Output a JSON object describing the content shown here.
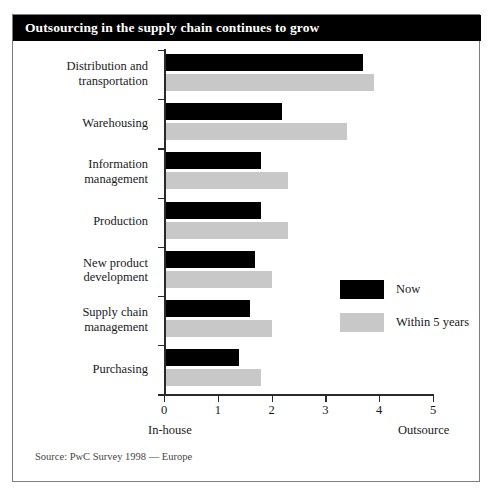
{
  "figure": {
    "title": "Outsourcing in the supply chain continues to grow",
    "source_note": "Source: PwC Survey 1998 — Europe"
  },
  "legend": {
    "position": "inside-right",
    "items": [
      {
        "label": "Now",
        "color": "#000000",
        "swatch_name": "legend-swatch-now"
      },
      {
        "label": "Within 5 years",
        "color": "#c8c8c8",
        "swatch_name": "legend-swatch-within-5-years"
      }
    ]
  },
  "axis": {
    "x_tick_labels": [
      "0",
      "1",
      "2",
      "3",
      "4",
      "5"
    ],
    "x_left_label": "In-house",
    "x_right_label": "Outsource"
  },
  "chart_data": {
    "type": "bar",
    "orientation": "horizontal",
    "title": "Outsourcing in the supply chain continues to grow",
    "xlabel": "",
    "ylabel": "",
    "xlim": [
      0,
      5
    ],
    "xticks": [
      0,
      1,
      2,
      3,
      4,
      5
    ],
    "grid": false,
    "legend_position": "inside-right",
    "x_axis_endpoint_labels": {
      "left": "In-house",
      "right": "Outsource"
    },
    "source": "Source: PwC Survey 1998 — Europe",
    "categories": [
      "Distribution and transportation",
      "Warehousing",
      "Information management",
      "Production",
      "New product development",
      "Supply chain management",
      "Purchasing"
    ],
    "category_lines": [
      [
        "Distribution and",
        "transportation"
      ],
      [
        "Warehousing"
      ],
      [
        "Information",
        "management"
      ],
      [
        "Production"
      ],
      [
        "New product",
        "development"
      ],
      [
        "Supply chain",
        "management"
      ],
      [
        "Purchasing"
      ]
    ],
    "series": [
      {
        "name": "Now",
        "color": "#000000",
        "values": [
          3.7,
          2.2,
          1.8,
          1.8,
          1.7,
          1.6,
          1.4
        ]
      },
      {
        "name": "Within 5 years",
        "color": "#c8c8c8",
        "values": [
          3.9,
          3.4,
          2.3,
          2.3,
          2.0,
          2.0,
          1.8
        ]
      }
    ]
  }
}
